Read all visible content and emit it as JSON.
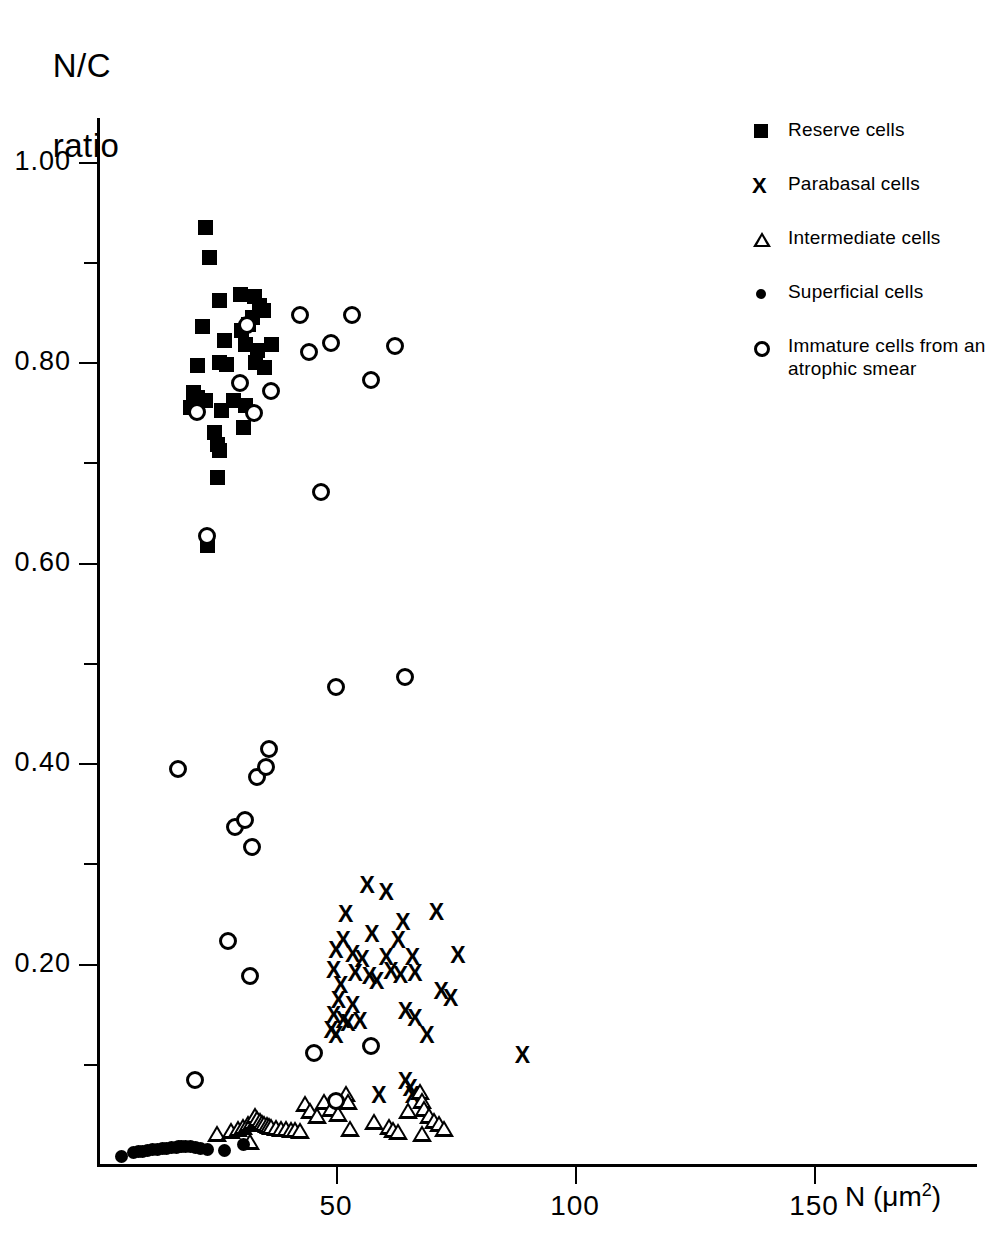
{
  "axes": {
    "ylabel_line1": "N/C",
    "ylabel_line2": "ratio",
    "xlabel_text": "N (μm",
    "xlabel_sup": "2",
    "xlabel_close": ")",
    "yticks": [
      "1.00",
      "0.80",
      "0.60",
      "0.40",
      "0.20"
    ],
    "ytick_values": [
      1.0,
      0.8,
      0.6,
      0.4,
      0.2
    ],
    "yminor_values": [
      0.9,
      0.7,
      0.5,
      0.3,
      0.1
    ],
    "xticks": [
      "50",
      "100",
      "150"
    ],
    "xtick_values": [
      50,
      100,
      150
    ]
  },
  "legend": {
    "items": [
      {
        "label": "Reserve cells",
        "marker": "filled-square"
      },
      {
        "label": "Parabasal cells",
        "marker": "x-cross"
      },
      {
        "label": "Intermediate cells",
        "marker": "open-triangle"
      },
      {
        "label": "Superficial cells",
        "marker": "filled-dot"
      },
      {
        "label": "Immature cells from an atrophic smear",
        "marker": "open-circle"
      }
    ]
  },
  "chart_data": {
    "type": "scatter",
    "title": "",
    "xlabel": "N (μm2)",
    "ylabel": "N/C ratio",
    "xlim": [
      0,
      175
    ],
    "ylim": [
      0,
      1.05
    ],
    "grid": false,
    "legend_position": "top-right",
    "series": [
      {
        "name": "Reserve cells",
        "marker": "filled-square",
        "points": [
          [
            22.5,
            0.935
          ],
          [
            23.5,
            0.905
          ],
          [
            25.5,
            0.862
          ],
          [
            30.0,
            0.868
          ],
          [
            32.8,
            0.866
          ],
          [
            33.8,
            0.857
          ],
          [
            34.8,
            0.852
          ],
          [
            32.5,
            0.845
          ],
          [
            31.5,
            0.838
          ],
          [
            30.2,
            0.832
          ],
          [
            22.0,
            0.836
          ],
          [
            26.5,
            0.822
          ],
          [
            31.0,
            0.818
          ],
          [
            33.5,
            0.812
          ],
          [
            36.5,
            0.818
          ],
          [
            21.0,
            0.797
          ],
          [
            25.5,
            0.8
          ],
          [
            27.0,
            0.798
          ],
          [
            33.0,
            0.8
          ],
          [
            35.0,
            0.795
          ],
          [
            20.0,
            0.77
          ],
          [
            21.0,
            0.765
          ],
          [
            22.5,
            0.762
          ],
          [
            28.5,
            0.762
          ],
          [
            31.0,
            0.757
          ],
          [
            19.5,
            0.755
          ],
          [
            26.0,
            0.752
          ],
          [
            30.5,
            0.735
          ],
          [
            24.5,
            0.73
          ],
          [
            25.0,
            0.718
          ],
          [
            25.5,
            0.712
          ],
          [
            25.0,
            0.685
          ],
          [
            23.0,
            0.617
          ]
        ]
      },
      {
        "name": "Parabasal cells",
        "marker": "x-cross",
        "points": [
          [
            56.5,
            0.277
          ],
          [
            60.5,
            0.27
          ],
          [
            52.0,
            0.248
          ],
          [
            64.0,
            0.24
          ],
          [
            71.0,
            0.25
          ],
          [
            51.5,
            0.222
          ],
          [
            57.5,
            0.228
          ],
          [
            63.0,
            0.222
          ],
          [
            50.0,
            0.212
          ],
          [
            53.5,
            0.208
          ],
          [
            55.5,
            0.203
          ],
          [
            60.5,
            0.205
          ],
          [
            66.0,
            0.205
          ],
          [
            75.5,
            0.207
          ],
          [
            49.5,
            0.193
          ],
          [
            54.0,
            0.19
          ],
          [
            57.0,
            0.187
          ],
          [
            61.5,
            0.192
          ],
          [
            63.5,
            0.188
          ],
          [
            66.5,
            0.19
          ],
          [
            51.0,
            0.178
          ],
          [
            58.5,
            0.182
          ],
          [
            72.0,
            0.172
          ],
          [
            50.5,
            0.163
          ],
          [
            53.5,
            0.158
          ],
          [
            74.0,
            0.165
          ],
          [
            49.5,
            0.148
          ],
          [
            51.5,
            0.143
          ],
          [
            52.5,
            0.14
          ],
          [
            55.0,
            0.142
          ],
          [
            64.5,
            0.152
          ],
          [
            66.5,
            0.145
          ],
          [
            49.0,
            0.133
          ],
          [
            50.0,
            0.128
          ],
          [
            69.0,
            0.128
          ],
          [
            64.5,
            0.082
          ],
          [
            65.5,
            0.075
          ],
          [
            59.0,
            0.068
          ],
          [
            66.0,
            0.068
          ],
          [
            89.0,
            0.108
          ]
        ]
      },
      {
        "name": "Intermediate cells",
        "marker": "open-triangle",
        "points": [
          [
            25.0,
            0.03
          ],
          [
            28.0,
            0.033
          ],
          [
            29.5,
            0.035
          ],
          [
            30.5,
            0.037
          ],
          [
            31.5,
            0.04
          ],
          [
            32.5,
            0.042
          ],
          [
            33.0,
            0.048
          ],
          [
            33.5,
            0.045
          ],
          [
            34.0,
            0.043
          ],
          [
            34.5,
            0.041
          ],
          [
            35.0,
            0.04
          ],
          [
            35.5,
            0.039
          ],
          [
            36.0,
            0.038
          ],
          [
            36.5,
            0.037
          ],
          [
            37.5,
            0.036
          ],
          [
            38.5,
            0.035
          ],
          [
            39.5,
            0.035
          ],
          [
            40.5,
            0.034
          ],
          [
            41.5,
            0.034
          ],
          [
            42.5,
            0.033
          ],
          [
            32.0,
            0.022
          ],
          [
            43.5,
            0.06
          ],
          [
            44.5,
            0.053
          ],
          [
            46.0,
            0.048
          ],
          [
            47.5,
            0.062
          ],
          [
            49.0,
            0.055
          ],
          [
            50.5,
            0.05
          ],
          [
            52.0,
            0.07
          ],
          [
            52.5,
            0.062
          ],
          [
            53.0,
            0.035
          ],
          [
            58.0,
            0.042
          ],
          [
            61.0,
            0.037
          ],
          [
            62.0,
            0.034
          ],
          [
            63.0,
            0.032
          ],
          [
            65.0,
            0.053
          ],
          [
            67.5,
            0.072
          ],
          [
            68.0,
            0.063
          ],
          [
            68.5,
            0.055
          ],
          [
            69.5,
            0.048
          ],
          [
            70.5,
            0.043
          ],
          [
            71.5,
            0.04
          ],
          [
            68.0,
            0.03
          ],
          [
            72.5,
            0.035
          ]
        ]
      },
      {
        "name": "Superficial cells",
        "marker": "filled-dot",
        "points": [
          [
            5.0,
            0.008
          ],
          [
            7.5,
            0.012
          ],
          [
            8.5,
            0.013
          ],
          [
            9.5,
            0.013
          ],
          [
            10.5,
            0.014
          ],
          [
            11.5,
            0.015
          ],
          [
            12.5,
            0.015
          ],
          [
            13.5,
            0.016
          ],
          [
            14.5,
            0.016
          ],
          [
            15.5,
            0.017
          ],
          [
            16.5,
            0.017
          ],
          [
            17.0,
            0.018
          ],
          [
            17.5,
            0.018
          ],
          [
            18.5,
            0.018
          ],
          [
            19.5,
            0.018
          ],
          [
            20.5,
            0.017
          ],
          [
            21.5,
            0.016
          ],
          [
            23.0,
            0.015
          ],
          [
            26.5,
            0.014
          ],
          [
            30.5,
            0.02
          ]
        ]
      },
      {
        "name": "Immature cells from an atrophic smear",
        "marker": "open-circle",
        "points": [
          [
            42.0,
            0.849
          ],
          [
            53.0,
            0.849
          ],
          [
            31.0,
            0.839
          ],
          [
            48.5,
            0.821
          ],
          [
            62.0,
            0.818
          ],
          [
            44.0,
            0.812
          ],
          [
            57.0,
            0.784
          ],
          [
            29.5,
            0.781
          ],
          [
            36.0,
            0.773
          ],
          [
            20.5,
            0.752
          ],
          [
            32.5,
            0.751
          ],
          [
            46.5,
            0.672
          ],
          [
            22.5,
            0.628
          ],
          [
            49.5,
            0.478
          ],
          [
            64.0,
            0.488
          ],
          [
            35.5,
            0.416
          ],
          [
            16.5,
            0.396
          ],
          [
            33.0,
            0.388
          ],
          [
            35.0,
            0.398
          ],
          [
            28.5,
            0.338
          ],
          [
            30.5,
            0.345
          ],
          [
            32.0,
            0.318
          ],
          [
            27.0,
            0.224
          ],
          [
            31.5,
            0.19
          ],
          [
            45.0,
            0.113
          ],
          [
            57.0,
            0.12
          ],
          [
            49.5,
            0.065
          ],
          [
            20.0,
            0.086
          ]
        ]
      }
    ]
  }
}
